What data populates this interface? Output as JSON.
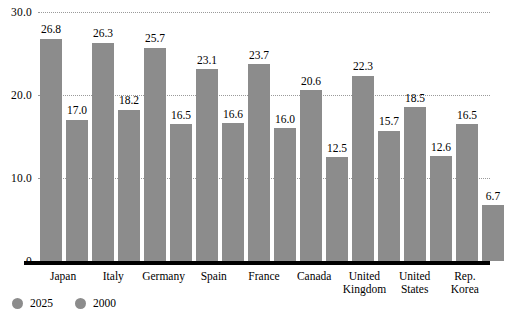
{
  "chart_data": {
    "type": "bar",
    "title": "",
    "subtitle": "",
    "xlabel": "",
    "ylabel": "",
    "ylim": [
      0,
      30
    ],
    "yticks": [
      0,
      10,
      20,
      30
    ],
    "ytick_labels": [
      "0",
      "10.0",
      "20.0",
      "30.0"
    ],
    "grid": true,
    "grid_style": "dotted-horizontal",
    "legend_position": "bottom-left",
    "bar_color": "#8c8c8c",
    "categories": [
      "Japan",
      "Italy",
      "Germany",
      "Spain",
      "France",
      "Canada",
      "United\nKingdom",
      "United\nStates",
      "Rep.\nKorea"
    ],
    "series": [
      {
        "name": "2025",
        "color": "#8c8c8c",
        "values": [
          26.8,
          26.3,
          25.7,
          23.1,
          23.7,
          20.6,
          22.3,
          18.5,
          16.5
        ],
        "labels": [
          "26.8",
          "26.3",
          "25.7",
          "23.1",
          "23.7",
          "20.6",
          "22.3",
          "18.5",
          "16.5"
        ]
      },
      {
        "name": "2000",
        "color": "#8c8c8c",
        "values": [
          17.0,
          18.2,
          16.5,
          16.6,
          16.0,
          12.5,
          15.7,
          12.6,
          6.7
        ],
        "labels": [
          "17.0",
          "18.2",
          "16.5",
          "16.6",
          "16.0",
          "12.5",
          "15.7",
          "12.6",
          "6.7"
        ]
      }
    ]
  },
  "legend": {
    "items": [
      {
        "label": "2025",
        "swatch": "legend-swatch-2025"
      },
      {
        "label": "2000",
        "swatch": "legend-swatch-2000"
      }
    ]
  }
}
